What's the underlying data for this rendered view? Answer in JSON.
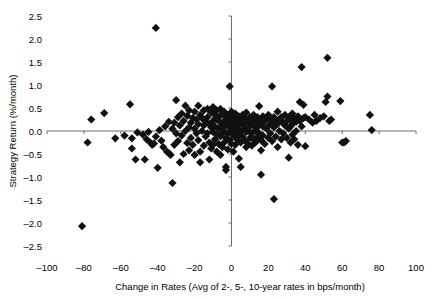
{
  "chart_data": {
    "type": "scatter",
    "title": "",
    "xlabel": "Change in Rates (Avg of 2-, 5-, 10-year rates in bps/month)",
    "ylabel": "Strategy Return (%/month)",
    "xlim": [
      -100,
      100
    ],
    "ylim": [
      -2.5,
      2.5
    ],
    "xticks": [
      -100,
      -80,
      -60,
      -40,
      -20,
      0,
      20,
      40,
      60,
      80,
      100
    ],
    "xtick_labels": [
      "–100",
      "–80",
      "–60",
      "–40",
      "–20",
      "0",
      "20",
      "40",
      "60",
      "80",
      "100"
    ],
    "yticks": [
      -2.5,
      -2.0,
      -1.5,
      -1.0,
      -0.5,
      0.0,
      0.5,
      1.0,
      1.5,
      2.0,
      2.5
    ],
    "ytick_labels": [
      "–2.5",
      "–2.0",
      "–1.5",
      "–1.0",
      "–0.5",
      "0.0",
      "0.5",
      "1.0",
      "1.5",
      "2.0",
      "2.5"
    ],
    "grid": false,
    "legend": false,
    "marker": {
      "shape": "diamond",
      "color": "#111111",
      "size": 5
    },
    "axis_color": "#6b6b6b",
    "series": [
      {
        "name": "Monthly observations",
        "points": [
          [
            -81,
            -2.07
          ],
          [
            -41,
            2.24
          ],
          [
            -76,
            0.25
          ],
          [
            -78,
            -0.25
          ],
          [
            -69,
            0.39
          ],
          [
            -63,
            -0.16
          ],
          [
            -58,
            -0.1
          ],
          [
            -55,
            0.58
          ],
          [
            -54,
            -0.16
          ],
          [
            -54,
            -0.38
          ],
          [
            -52,
            -0.62
          ],
          [
            -51,
            -0.03
          ],
          [
            -48,
            -0.08
          ],
          [
            -47,
            -0.62
          ],
          [
            -46,
            -0.18
          ],
          [
            -45,
            -0.02
          ],
          [
            -44,
            -0.25
          ],
          [
            -43,
            -0.3
          ],
          [
            -42,
            -0.27
          ],
          [
            -41,
            -0.12
          ],
          [
            -40,
            -0.8
          ],
          [
            -39,
            0.02
          ],
          [
            -38,
            -0.21
          ],
          [
            -37,
            -0.35
          ],
          [
            -36,
            0.1
          ],
          [
            -35,
            -0.45
          ],
          [
            -34,
            0.2
          ],
          [
            -34,
            -0.48
          ],
          [
            -33,
            -0.52
          ],
          [
            -32,
            -1.13
          ],
          [
            -32,
            0.05
          ],
          [
            -31,
            0.18
          ],
          [
            -31,
            -0.3
          ],
          [
            -30,
            0.67
          ],
          [
            -30,
            -0.05
          ],
          [
            -29,
            0.3
          ],
          [
            -29,
            -0.22
          ],
          [
            -28,
            0.12
          ],
          [
            -28,
            -0.68
          ],
          [
            -27,
            0.38
          ],
          [
            -27,
            -0.1
          ],
          [
            -26,
            0.22
          ],
          [
            -26,
            -0.5
          ],
          [
            -25,
            0.55
          ],
          [
            -25,
            0.0
          ],
          [
            -24,
            0.33
          ],
          [
            -24,
            -0.26
          ],
          [
            -23,
            0.45
          ],
          [
            -23,
            0.08
          ],
          [
            -23,
            -0.42
          ],
          [
            -22,
            0.18
          ],
          [
            -22,
            -0.15
          ],
          [
            -21,
            0.28
          ],
          [
            -21,
            -0.3
          ],
          [
            -20,
            0.42
          ],
          [
            -20,
            0.05
          ],
          [
            -20,
            -0.52
          ],
          [
            -19,
            0.25
          ],
          [
            -19,
            -0.05
          ],
          [
            -18,
            0.55
          ],
          [
            -18,
            0.15
          ],
          [
            -18,
            -0.2
          ],
          [
            -17,
            0.35
          ],
          [
            -17,
            -0.45
          ],
          [
            -17,
            -0.68
          ],
          [
            -16,
            0.28
          ],
          [
            -16,
            0.0
          ],
          [
            -15,
            0.45
          ],
          [
            -15,
            0.12
          ],
          [
            -15,
            -0.32
          ],
          [
            -14,
            0.2
          ],
          [
            -14,
            -0.12
          ],
          [
            -13,
            0.48
          ],
          [
            -13,
            0.3
          ],
          [
            -13,
            -0.05
          ],
          [
            -12,
            0.15
          ],
          [
            -12,
            -0.25
          ],
          [
            -12,
            -0.62
          ],
          [
            -11,
            0.4
          ],
          [
            -11,
            0.08
          ],
          [
            -11,
            -0.38
          ],
          [
            -10,
            0.52
          ],
          [
            -10,
            0.22
          ],
          [
            -10,
            -0.02
          ],
          [
            -10,
            -0.3
          ],
          [
            -9,
            0.35
          ],
          [
            -9,
            0.1
          ],
          [
            -9,
            -0.18
          ],
          [
            -8,
            0.45
          ],
          [
            -8,
            0.25
          ],
          [
            -8,
            -0.08
          ],
          [
            -8,
            -0.45
          ],
          [
            -7,
            0.3
          ],
          [
            -7,
            0.05
          ],
          [
            -7,
            -0.28
          ],
          [
            -6,
            0.48
          ],
          [
            -6,
            0.18
          ],
          [
            -6,
            -0.12
          ],
          [
            -6,
            -0.52
          ],
          [
            -5,
            0.38
          ],
          [
            -5,
            0.1
          ],
          [
            -5,
            -0.05
          ],
          [
            -5,
            -0.35
          ],
          [
            -4,
            0.42
          ],
          [
            -4,
            0.22
          ],
          [
            -4,
            0.0
          ],
          [
            -4,
            -0.25
          ],
          [
            -3,
            0.3
          ],
          [
            -3,
            0.12
          ],
          [
            -3,
            -0.15
          ],
          [
            -3,
            -0.78
          ],
          [
            -3,
            -0.85
          ],
          [
            -2,
            0.35
          ],
          [
            -2,
            0.18
          ],
          [
            -2,
            -0.05
          ],
          [
            -2,
            -0.4
          ],
          [
            -1,
            0.25
          ],
          [
            -1,
            0.08
          ],
          [
            -1,
            -0.2
          ],
          [
            -1,
            0.97
          ],
          [
            0,
            0.42
          ],
          [
            0,
            0.2
          ],
          [
            0,
            0.0
          ],
          [
            0,
            -0.28
          ],
          [
            1,
            0.3
          ],
          [
            1,
            0.1
          ],
          [
            1,
            -0.1
          ],
          [
            1,
            -0.45
          ],
          [
            2,
            0.38
          ],
          [
            2,
            0.15
          ],
          [
            2,
            -0.05
          ],
          [
            2,
            -0.3
          ],
          [
            3,
            0.25
          ],
          [
            3,
            0.05
          ],
          [
            3,
            -0.18
          ],
          [
            4,
            0.32
          ],
          [
            4,
            0.12
          ],
          [
            4,
            -0.08
          ],
          [
            4,
            -0.6
          ],
          [
            5,
            0.2
          ],
          [
            5,
            0.0
          ],
          [
            5,
            -0.25
          ],
          [
            5,
            -0.78
          ],
          [
            6,
            0.35
          ],
          [
            6,
            0.15
          ],
          [
            6,
            -0.12
          ],
          [
            7,
            0.28
          ],
          [
            7,
            0.05
          ],
          [
            7,
            -0.2
          ],
          [
            8,
            0.4
          ],
          [
            8,
            0.18
          ],
          [
            8,
            -0.02
          ],
          [
            8,
            -0.35
          ],
          [
            9,
            0.22
          ],
          [
            9,
            0.0
          ],
          [
            9,
            -0.28
          ],
          [
            10,
            0.3
          ],
          [
            10,
            0.1
          ],
          [
            10,
            -0.15
          ],
          [
            11,
            0.2
          ],
          [
            11,
            -0.05
          ],
          [
            11,
            -0.32
          ],
          [
            12,
            0.35
          ],
          [
            12,
            0.12
          ],
          [
            12,
            -0.18
          ],
          [
            13,
            0.25
          ],
          [
            13,
            0.02
          ],
          [
            13,
            -0.25
          ],
          [
            14,
            0.3
          ],
          [
            14,
            0.08
          ],
          [
            14,
            -0.12
          ],
          [
            15,
            0.54
          ],
          [
            15,
            0.18
          ],
          [
            15,
            -0.05
          ],
          [
            16,
            0.25
          ],
          [
            16,
            -0.2
          ],
          [
            16,
            -0.42
          ],
          [
            16,
            -0.95
          ],
          [
            17,
            0.32
          ],
          [
            17,
            0.1
          ],
          [
            17,
            -0.1
          ],
          [
            18,
            0.22
          ],
          [
            18,
            -0.28
          ],
          [
            19,
            0.28
          ],
          [
            19,
            0.05
          ],
          [
            20,
            0.35
          ],
          [
            20,
            0.12
          ],
          [
            20,
            -0.15
          ],
          [
            21,
            0.25
          ],
          [
            21,
            -0.05
          ],
          [
            22,
            0.97
          ],
          [
            22,
            0.18
          ],
          [
            22,
            -0.22
          ],
          [
            23,
            0.3
          ],
          [
            23,
            0.08
          ],
          [
            23,
            -1.48
          ],
          [
            24,
            0.2
          ],
          [
            24,
            -0.12
          ],
          [
            25,
            0.42
          ],
          [
            25,
            0.15
          ],
          [
            25,
            -0.35
          ],
          [
            26,
            0.25
          ],
          [
            26,
            0.0
          ],
          [
            27,
            0.3
          ],
          [
            27,
            -0.18
          ],
          [
            28,
            0.18
          ],
          [
            28,
            -0.05
          ],
          [
            29,
            0.35
          ],
          [
            29,
            0.12
          ],
          [
            30,
            0.22
          ],
          [
            30,
            -0.15
          ],
          [
            31,
            0.3
          ],
          [
            31,
            0.05
          ],
          [
            31,
            -0.58
          ],
          [
            32,
            0.25
          ],
          [
            32,
            0.1
          ],
          [
            32,
            -0.25
          ],
          [
            33,
            0.38
          ],
          [
            33,
            0.15
          ],
          [
            33,
            -0.08
          ],
          [
            34,
            0.28
          ],
          [
            34,
            -0.18
          ],
          [
            35,
            0.2
          ],
          [
            35,
            0.0
          ],
          [
            36,
            0.32
          ],
          [
            36,
            -0.3
          ],
          [
            37,
            0.63
          ],
          [
            37,
            0.22
          ],
          [
            38,
            1.39
          ],
          [
            38,
            0.1
          ],
          [
            39,
            0.57
          ],
          [
            39,
            0.28
          ],
          [
            40,
            0.3
          ],
          [
            40,
            -0.33
          ],
          [
            42,
            0.25
          ],
          [
            44,
            0.18
          ],
          [
            45,
            0.35
          ],
          [
            46,
            0.22
          ],
          [
            48,
            0.28
          ],
          [
            50,
            0.32
          ],
          [
            51,
            0.63
          ],
          [
            52,
            0.75
          ],
          [
            52,
            1.59
          ],
          [
            53,
            0.22
          ],
          [
            54,
            0.25
          ],
          [
            59,
            0.65
          ],
          [
            60,
            -0.25
          ],
          [
            61,
            -0.25
          ],
          [
            62,
            -0.22
          ],
          [
            75,
            0.35
          ],
          [
            76,
            0.02
          ]
        ]
      }
    ]
  },
  "axes": {
    "y_axis_title": "Strategy Return (%/month)",
    "x_axis_title": "Change in Rates (Avg of 2-, 5-, 10-year rates in bps/month)"
  }
}
